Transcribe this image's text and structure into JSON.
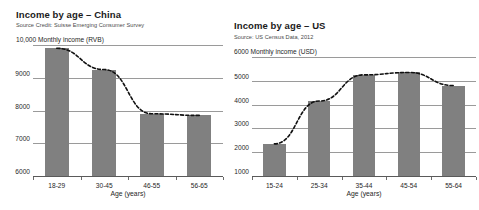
{
  "figure": {
    "x_axis_title": "Age (years)"
  },
  "panels": [
    {
      "id": "china",
      "title": "Income by age – China",
      "source": "Source Credit: Suisse Emerging Consumer Survey",
      "y_axis_caption": "10,000 Monthly income (RVB)",
      "x_axis_title": "Age (years)"
    },
    {
      "id": "us",
      "title": "Income by age – US",
      "source": "Source: US Census Data, 2012",
      "y_axis_caption": "6000 Monthly income (USD)",
      "x_axis_title": "Age (years)"
    }
  ],
  "chart_data": [
    {
      "type": "bar",
      "id": "income-by-age-china",
      "title": "Income by age – China",
      "subtitle": "Source Credit: Suisse Emerging Consumer Survey",
      "xlabel": "Age (years)",
      "ylabel": "Monthly income (RVB)",
      "categories": [
        "18-29",
        "30-45",
        "46-55",
        "56-65"
      ],
      "values": [
        9900,
        9250,
        7900,
        7850
      ],
      "ylim": [
        6000,
        10000
      ],
      "yticks": [
        6000,
        7000,
        8000,
        9000,
        10000
      ],
      "ytick_labels": [
        "6000",
        "7000",
        "8000",
        "9000",
        "10,000"
      ],
      "grid": true,
      "legend": "none",
      "bar_color": "#808080",
      "overlay": {
        "type": "line",
        "style": "dashed",
        "color": "#111111",
        "values": [
          9900,
          9250,
          7900,
          7850
        ]
      }
    },
    {
      "type": "bar",
      "id": "income-by-age-us",
      "title": "Income by age – US",
      "subtitle": "Source: US Census Data, 2012",
      "xlabel": "Age (years)",
      "ylabel": "Monthly income (USD)",
      "categories": [
        "15-24",
        "25-34",
        "35-44",
        "45-54",
        "55-64"
      ],
      "values": [
        2350,
        4150,
        5250,
        5350,
        4800
      ],
      "ylim": [
        1000,
        6000
      ],
      "yticks": [
        1000,
        2000,
        3000,
        4000,
        5000,
        6000
      ],
      "ytick_labels": [
        "1000",
        "2000",
        "3000",
        "4000",
        "5000",
        "6000"
      ],
      "grid": true,
      "legend": "none",
      "bar_color": "#808080",
      "overlay": {
        "type": "line",
        "style": "dashed",
        "color": "#111111",
        "values": [
          2350,
          4150,
          5250,
          5350,
          4800
        ]
      }
    }
  ]
}
